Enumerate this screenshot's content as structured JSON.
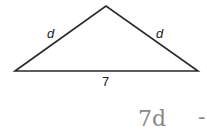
{
  "diagram": {
    "type": "isosceles-triangle",
    "vertices": {
      "left": [
        15,
        71
      ],
      "apex": [
        106,
        6
      ],
      "right": [
        198,
        71
      ]
    },
    "labels": {
      "left_side": "d",
      "right_side": "d",
      "base": "7"
    }
  },
  "handwriting": {
    "text": "7d",
    "trailing_mark": "-"
  },
  "colors": {
    "line": "#2a2a2a",
    "handwriting": "#8a8a8a"
  }
}
